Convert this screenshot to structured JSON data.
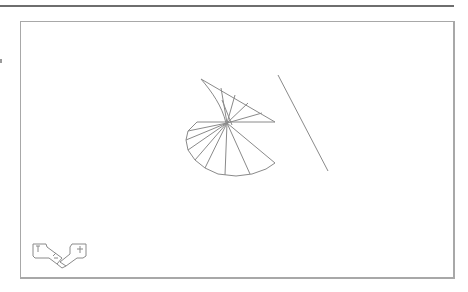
{
  "window": {
    "title": "",
    "frame_color": "#6e6e6e",
    "viewport_border_color": "#a8a8a8"
  },
  "viewport": {
    "background": "#ffffff",
    "stroke_color": "#8a8a8a",
    "objects": [
      {
        "name": "helical-fan-wireframe",
        "type": "3d-wireframe"
      },
      {
        "name": "diagonal-line",
        "type": "line",
        "from": [
          278,
          75
        ],
        "to": [
          328,
          171
        ]
      }
    ]
  },
  "ucs_icon": {
    "label": "ucs-icon",
    "axes": [
      "X",
      "Y"
    ]
  }
}
